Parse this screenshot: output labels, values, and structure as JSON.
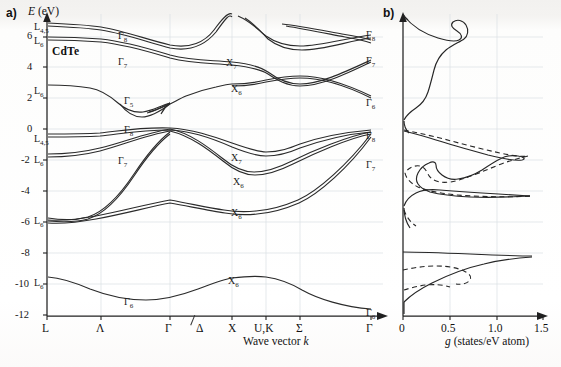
{
  "figure": {
    "panel_a_letter": "a)",
    "panel_b_letter": "b)",
    "material": "CdTe",
    "y_axis_title": "E (eV)",
    "x_axis_title_a": "Wave vector k",
    "x_axis_title_b": "g (states/eV atom)"
  },
  "axes": {
    "energy_ticks": [
      "6",
      "4",
      "2",
      "0",
      "-2",
      "-4",
      "-6",
      "-8",
      "-10",
      "-12"
    ],
    "energy_min": -12,
    "energy_max": 7,
    "kpoints": [
      "L",
      "Λ",
      "Γ",
      "Δ",
      "X",
      "U,K",
      "Σ",
      "Γ"
    ],
    "dos_ticks": [
      "0",
      "0.5",
      "1.0",
      "1.5"
    ],
    "dos_min": 0,
    "dos_max": 1.5
  },
  "band_labels_left": [
    {
      "text": "L",
      "sub": "4,5",
      "x": 34,
      "y": 21
    },
    {
      "text": "L",
      "sub": "6",
      "x": 34,
      "y": 35
    },
    {
      "text": "L",
      "sub": "6",
      "x": 34,
      "y": 85
    },
    {
      "text": "L",
      "sub": "4,5",
      "x": 34,
      "y": 133
    },
    {
      "text": "L",
      "sub": "6",
      "x": 34,
      "y": 154
    },
    {
      "text": "L",
      "sub": "6",
      "x": 34,
      "y": 215
    },
    {
      "text": "L",
      "sub": "6",
      "x": 34,
      "y": 277
    }
  ],
  "band_labels_gamma": [
    {
      "text": "Γ",
      "sub": "8",
      "x": 118,
      "y": 30
    },
    {
      "text": "Γ",
      "sub": "7",
      "x": 118,
      "y": 56
    },
    {
      "text": "Γ",
      "sub": "5",
      "x": 124,
      "y": 95
    },
    {
      "text": "Γ",
      "sub": "8",
      "x": 124,
      "y": 124
    },
    {
      "text": "Γ",
      "sub": "7",
      "x": 118,
      "y": 155
    },
    {
      "text": "Γ",
      "sub": "6",
      "x": 124,
      "y": 296
    }
  ],
  "band_labels_x": [
    {
      "text": "X",
      "sub": "7",
      "x": 226,
      "y": 57
    },
    {
      "text": "X",
      "sub": "6",
      "x": 231,
      "y": 83
    },
    {
      "text": "X",
      "sub": "7",
      "x": 231,
      "y": 152
    },
    {
      "text": "X",
      "sub": "6",
      "x": 233,
      "y": 176
    },
    {
      "text": "X",
      "sub": "6",
      "x": 231,
      "y": 207
    },
    {
      "text": "X",
      "sub": "6",
      "x": 228,
      "y": 275
    }
  ],
  "band_labels_right": [
    {
      "text": "Γ",
      "sub": "8",
      "x": 366,
      "y": 29
    },
    {
      "text": "Γ",
      "sub": "7",
      "x": 366,
      "y": 55
    },
    {
      "text": "Γ",
      "sub": "6",
      "x": 366,
      "y": 97
    },
    {
      "text": "Γ",
      "sub": "8",
      "x": 366,
      "y": 130
    },
    {
      "text": "Γ",
      "sub": "7",
      "x": 366,
      "y": 159
    },
    {
      "text": "Γ",
      "sub": "6",
      "x": 366,
      "y": 307
    }
  ],
  "chart_data": {
    "type": "line",
    "subplots": [
      {
        "name": "band-structure",
        "label": "a)",
        "xlabel": "Wave vector k",
        "ylabel": "E (eV)",
        "ylim": [
          -12,
          7
        ],
        "xticks": [
          "L",
          "Λ",
          "Γ",
          "Δ",
          "X",
          "U,K",
          "Σ",
          "Γ"
        ],
        "yticks": [
          6,
          4,
          2,
          0,
          -2,
          -4,
          -6,
          -8,
          -10,
          -12
        ],
        "grid": true,
        "critical_points": {
          "L45_upper": 6.6,
          "L6_upper": 6.0,
          "L6_cond": 3.1,
          "Gamma8_cond": 6.2,
          "Gamma7_cond": 5.0,
          "Gamma6_cond": 1.6,
          "X7_cond": 4.6,
          "X6_cond": 3.8,
          "L45_val": 0.0,
          "L6_val": -0.9,
          "Gamma8_val": 0.1,
          "Gamma7_val": -0.85,
          "X7_val": -1.9,
          "X6_val": -2.3,
          "X6_val2": -4.3,
          "L6_deep": -4.4,
          "Gamma6_deep": -10.9,
          "X6_deep": -9.3,
          "L6_low": -9.5
        }
      },
      {
        "name": "density-of-states",
        "label": "b)",
        "xlabel": "g (states/eV atom)",
        "xlim": [
          0,
          1.5
        ],
        "ylim": [
          -12,
          7
        ],
        "xticks": [
          0,
          0.5,
          1.0,
          1.5
        ],
        "grid": true,
        "series": [
          {
            "name": "total-dos",
            "style": "solid"
          },
          {
            "name": "partial-dos",
            "style": "dashed"
          }
        ]
      }
    ]
  }
}
